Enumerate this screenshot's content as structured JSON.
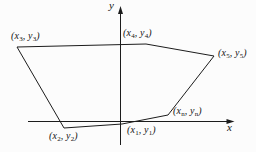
{
  "figure": {
    "colors": {
      "background": "#fcfcfc",
      "line": "#1c1c1c",
      "text": "#141414"
    },
    "axes": {
      "x_label": "x",
      "y_label": "y"
    },
    "vertices": [
      {
        "name": "v1",
        "pre": "(x",
        "x_sub": "1",
        "mid": ", y",
        "y_sub": "1",
        "post": ")"
      },
      {
        "name": "v2",
        "pre": "(x",
        "x_sub": "2",
        "mid": ", y",
        "y_sub": "2",
        "post": ")"
      },
      {
        "name": "v3",
        "pre": "(x",
        "x_sub": "3",
        "mid": ", y",
        "y_sub": "3",
        "post": ")"
      },
      {
        "name": "v4",
        "pre": "(x",
        "x_sub": "4",
        "mid": ", y",
        "y_sub": "4",
        "post": ")"
      },
      {
        "name": "v5",
        "pre": "(x",
        "x_sub": "5",
        "mid": ", y",
        "y_sub": "5",
        "post": ")"
      },
      {
        "name": "vn",
        "pre": "(x",
        "x_sub": "n",
        "mid": ", y",
        "y_sub": "n",
        "post": ")"
      }
    ]
  }
}
